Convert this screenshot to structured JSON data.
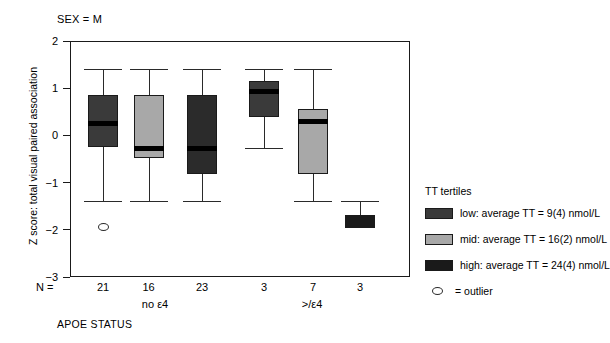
{
  "titles": {
    "panel": "SEX = M",
    "y_axis": "Z score: total visual paired association",
    "x_axis": "APOE STATUS",
    "n_prefix": "N ="
  },
  "legend": {
    "title": "TT tertiles",
    "items": [
      {
        "label": "low: average TT = 9(4) nmol/L",
        "color": "#3a3a3a",
        "key": "low"
      },
      {
        "label": "mid: average TT = 16(2) nmol/L",
        "color": "#a8a8a8",
        "key": "mid"
      },
      {
        "label": "high: average TT = 24(4) nmol/L",
        "color": "#1a1a1a",
        "key": "high"
      }
    ],
    "outlier_label": "= outlier"
  },
  "axis": {
    "y_ticks": [
      "2",
      "1",
      "0",
      "-1",
      "-2",
      "-3"
    ],
    "y_tick_values": [
      2,
      1,
      0,
      -1,
      -2,
      -3
    ],
    "ylim": [
      -3,
      2
    ],
    "group_labels": [
      "no ε4",
      ">/ε4"
    ],
    "n_labels": [
      "21",
      "16",
      "23",
      "3",
      "7",
      "3"
    ]
  },
  "chart_data": {
    "type": "box",
    "title": "SEX = M",
    "xlabel": "APOE STATUS",
    "ylabel": "Z score: total visual paired association",
    "ylim": [
      -3,
      2
    ],
    "grid": false,
    "legend_position": "right",
    "groups": [
      "no ε4",
      ">/ε4"
    ],
    "series": [
      "low",
      "mid",
      "high"
    ],
    "boxes": [
      {
        "group": "no ε4",
        "tertile": "low",
        "n": 21,
        "whisker_low": -1.4,
        "q1": -0.25,
        "median": 0.25,
        "q3": 0.85,
        "whisker_high": 1.4,
        "color": "#3a3a3a",
        "outliers": [
          -1.94
        ]
      },
      {
        "group": "no ε4",
        "tertile": "mid",
        "n": 16,
        "whisker_low": -1.4,
        "q1": -0.48,
        "median": -0.27,
        "q3": 0.85,
        "whisker_high": 1.4,
        "color": "#a8a8a8",
        "outliers": []
      },
      {
        "group": "no ε4",
        "tertile": "high",
        "n": 23,
        "whisker_low": -1.4,
        "q1": -0.82,
        "median": -0.27,
        "q3": 0.85,
        "whisker_high": 1.4,
        "color": "#2b2b2b",
        "outliers": []
      },
      {
        "group": ">/ε4",
        "tertile": "low",
        "n": 3,
        "whisker_low": -0.27,
        "q1": 0.4,
        "median": 0.93,
        "q3": 1.15,
        "whisker_high": 1.4,
        "color": "#3a3a3a",
        "outliers": []
      },
      {
        "group": ">/ε4",
        "tertile": "mid",
        "n": 7,
        "whisker_low": -1.4,
        "q1": -0.82,
        "median": 0.3,
        "q3": 0.56,
        "whisker_high": 1.4,
        "color": "#a8a8a8",
        "outliers": []
      },
      {
        "group": ">/ε4",
        "tertile": "high",
        "n": 3,
        "whisker_low": -1.4,
        "q1": -1.96,
        "median": null,
        "q3": -1.69,
        "whisker_high": -1.4,
        "color": "#1a1a1a",
        "outliers": []
      }
    ]
  },
  "layout": {
    "box_centers_px": [
      103,
      148.5,
      202,
      264,
      313,
      360
    ],
    "box_width_px": 30,
    "plot_left_px": 70,
    "plot_top_px": 41,
    "plot_width_px": 340,
    "plot_height_px": 236,
    "group_label_centers_px": [
      155,
      312
    ],
    "outlier_px": [
      103,
      227
    ]
  }
}
